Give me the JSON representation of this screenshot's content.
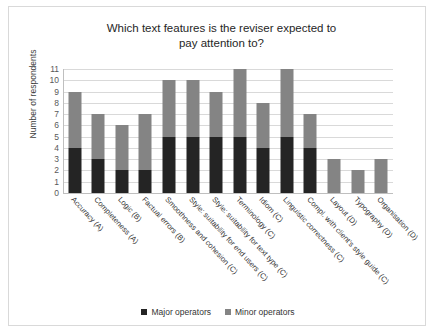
{
  "chart_data": {
    "type": "bar",
    "stacked": true,
    "title": "Which text features is the reviser expected to pay attention to?",
    "title_lines": [
      "Which text features is the reviser expected to",
      "pay attention to?"
    ],
    "xlabel": "",
    "ylabel": "Number of respondents",
    "ylim": [
      0,
      11
    ],
    "yticks": [
      11,
      10,
      9,
      8,
      7,
      6,
      5,
      4,
      3,
      2,
      1,
      0
    ],
    "grid": true,
    "legend_position": "bottom",
    "categories": [
      "Accuracy (A)",
      "Completeness (A)",
      "Logic (B)",
      "Factual errors (B)",
      "Smoothness and cohesion (C)",
      "Style: suitability for end users (C)",
      "Style: suitability for text type (C)",
      "Terminology (C)",
      "Idiom (C)",
      "Linguistic correctness (C)",
      "Compl. with client's style guide (C)",
      "Layout (D)",
      "Typography (D)",
      "Organisation (D)"
    ],
    "series": [
      {
        "name": "Major operators",
        "color": "#242424",
        "values": [
          4,
          3,
          2,
          2,
          5,
          5,
          5,
          5,
          4,
          5,
          4,
          0,
          0,
          0
        ]
      },
      {
        "name": "Minor operators",
        "color": "#848484",
        "values": [
          5,
          4,
          4,
          5,
          5,
          5,
          4,
          6,
          4,
          6,
          3,
          3,
          2,
          3
        ]
      }
    ],
    "totals": [
      9,
      7,
      6,
      7,
      10,
      10,
      9,
      11,
      8,
      11,
      7,
      3,
      2,
      3
    ]
  },
  "legend": {
    "items": [
      {
        "label": "Major operators",
        "swatch": "major"
      },
      {
        "label": "Minor operators",
        "swatch": "minor"
      }
    ]
  }
}
